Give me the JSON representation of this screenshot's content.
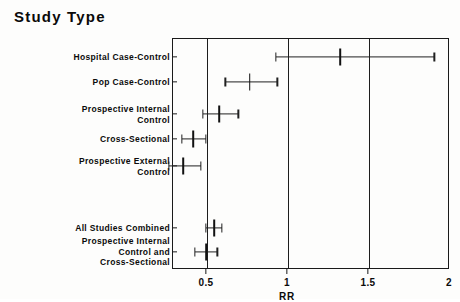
{
  "chart_data": {
    "type": "scatter",
    "title": "Study Type",
    "xlabel": "RR",
    "ylabel": "",
    "xlim": [
      0.29,
      2.0
    ],
    "xticks": [
      0.5,
      1,
      1.5,
      2
    ],
    "xtick_labels": [
      "0.5",
      "1",
      "1.5",
      "2"
    ],
    "grid": "vertical gridlines at 0.5, 1, 1.5",
    "legend": "none",
    "reference_line": 1,
    "categories": [
      "Hospital Case-Control",
      "Pop Case-Control",
      "Prospective Internal\nControl",
      "Cross-Sectional",
      "Prospective External\nControl",
      "All Studies Combined",
      "Prospective Internal\nControl and\nCross-Sectional"
    ],
    "points": [
      {
        "label": "Hospital Case-Control",
        "estimate": 1.33,
        "ci_low": 0.93,
        "ci_high": 1.91
      },
      {
        "label": "Pop Case-Control",
        "estimate": 0.77,
        "ci_low": 0.62,
        "ci_high": 0.94
      },
      {
        "label": "Prospective Internal Control",
        "estimate": 0.58,
        "ci_low": 0.48,
        "ci_high": 0.7
      },
      {
        "label": "Cross-Sectional",
        "estimate": 0.42,
        "ci_low": 0.35,
        "ci_high": 0.5
      },
      {
        "label": "Prospective External Control",
        "estimate": 0.36,
        "ci_low": 0.27,
        "ci_high": 0.47
      },
      {
        "label": "All Studies Combined",
        "estimate": 0.55,
        "ci_low": 0.5,
        "ci_high": 0.6
      },
      {
        "label": "Prospective Internal Control and Cross-Sectional",
        "estimate": 0.5,
        "ci_low": 0.43,
        "ci_high": 0.57
      }
    ]
  },
  "colors": {
    "ink": "#111111",
    "frame": "#1a1a1a",
    "background": "#ffffff"
  }
}
